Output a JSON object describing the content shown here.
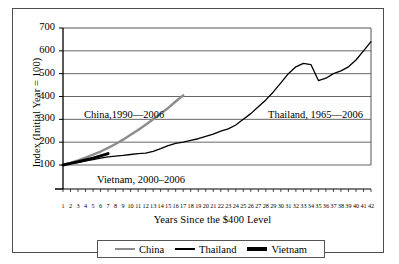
{
  "chart_data": {
    "type": "line",
    "title": "",
    "xlabel": "Years Since the $400 Level",
    "ylabel": "Index (Initial Year = 100)",
    "xlim": [
      0,
      43
    ],
    "ylim": [
      0,
      700
    ],
    "grid": true,
    "legend_position": "bottom",
    "ytick_labels": [
      "700",
      "600",
      "500",
      "400",
      "300",
      "200",
      "100"
    ],
    "ytick_values": [
      700,
      600,
      500,
      400,
      300,
      200,
      100
    ],
    "xtick_labels": [
      "1",
      "2",
      "3",
      "4",
      "5",
      "6",
      "7",
      "8",
      "9",
      "10",
      "11",
      "12",
      "13",
      "14",
      "15",
      "16",
      "17",
      "18",
      "19",
      "20",
      "21",
      "22",
      "23",
      "24",
      "25",
      "26",
      "27",
      "28",
      "29",
      "30",
      "31",
      "32",
      "33",
      "34",
      "35",
      "36",
      "37",
      "38",
      "39",
      "40",
      "41",
      "42"
    ],
    "series": [
      {
        "name": "China",
        "color": "#8c8c8c",
        "width": 2.4,
        "x": [
          1,
          2,
          3,
          4,
          5,
          6,
          7,
          8,
          9,
          10,
          11,
          12,
          13,
          14,
          15,
          16,
          17
        ],
        "values": [
          100,
          109,
          120,
          132,
          145,
          159,
          175,
          192,
          211,
          232,
          253,
          276,
          300,
          325,
          350,
          378,
          405
        ]
      },
      {
        "name": "Thailand",
        "color": "#000000",
        "width": 1.3,
        "x": [
          1,
          2,
          3,
          4,
          5,
          6,
          7,
          8,
          9,
          10,
          11,
          12,
          13,
          14,
          15,
          16,
          17,
          18,
          19,
          20,
          21,
          22,
          23,
          24,
          25,
          26,
          27,
          28,
          29,
          30,
          31,
          32,
          33,
          34,
          35,
          36,
          37,
          38,
          39,
          40,
          41,
          42
        ],
        "values": [
          100,
          106,
          112,
          118,
          124,
          130,
          136,
          139,
          142,
          146,
          150,
          152,
          160,
          172,
          185,
          195,
          200,
          208,
          215,
          225,
          235,
          248,
          258,
          275,
          300,
          325,
          355,
          385,
          420,
          460,
          500,
          530,
          545,
          540,
          470,
          480,
          500,
          512,
          530,
          560,
          600,
          640
        ]
      },
      {
        "name": "Vietnam",
        "color": "#000000",
        "width": 3.0,
        "x": [
          1,
          2,
          3,
          4,
          5,
          6,
          7
        ],
        "values": [
          100,
          107,
          114,
          122,
          130,
          140,
          150
        ]
      }
    ],
    "annotations": [
      {
        "id": "china",
        "text": "China,1990—2006"
      },
      {
        "id": "vietnam",
        "text": "Vietnam, 2000–2006"
      },
      {
        "id": "thailand",
        "text": "Thailand, 1965—2006"
      }
    ],
    "legend": [
      {
        "label": "China"
      },
      {
        "label": "Thailand"
      },
      {
        "label": "Vietnam"
      }
    ]
  }
}
